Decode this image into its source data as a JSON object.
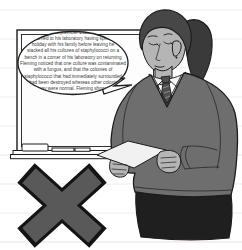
{
  "bubble": {
    "lines": [
      "in September 1928 he",
      "returned to his laboratory having spent a",
      "holiday with his family before leaving he",
      "stacked all his cultures of staphylococci on a",
      "bench in a corner of his laboratory on returning",
      "Fleming noticed that one culture was contaminated",
      "with a fungus, and that the colonies of",
      "staphylococci that had immediately surrounded",
      "it had been destroyed whereas other colonies",
      "away were normal. Fleming showed",
      "to his"
    ]
  },
  "icons": {
    "x_mark": "incorrect-cross"
  },
  "colors": {
    "ink": "#1c1c1c",
    "ruled_line": "#e9edf2",
    "ruled_line_pink": "#f2dfdf",
    "board": "#fdfdfd",
    "bubble_fill": "#ffffff",
    "bubble_text": "#3a3a3a",
    "hair": "#474747",
    "hair_dark": "#3a3a3a",
    "skin": "#b5b5b5",
    "shirt": "#f4f4f4",
    "tie": "#4f4f4f",
    "sweater": "#6e6e6e",
    "skirt": "#1f1f1f",
    "paper": "#f1f1f1",
    "x_fill": "#595959",
    "x_outline": "#141414"
  }
}
